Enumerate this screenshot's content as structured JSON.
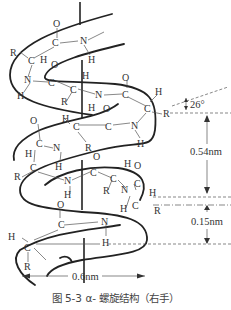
{
  "figure": {
    "caption": "图 5-3   α- 螺旋结构（右手）",
    "type": "alpha-helix protein secondary structure diagram",
    "handedness": "右手"
  },
  "annotations": {
    "angle": "26°",
    "rise_per_turn": "0.54nm",
    "rise_per_residue": "0.15nm",
    "diameter": "0.6nm"
  },
  "atoms": {
    "O": "O",
    "C": "C",
    "N": "N",
    "H": "H",
    "R": "R"
  },
  "colors": {
    "ink": "#222222",
    "text": "#333333",
    "background": "#ffffff"
  }
}
